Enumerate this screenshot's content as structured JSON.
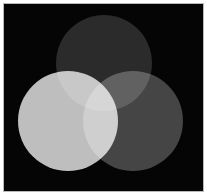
{
  "figure": {
    "width": 207,
    "height": 195,
    "background_color": "#ffffff",
    "plate_color": "#050505",
    "frame_color": "#b9b9b9",
    "blend_mode": "screen"
  },
  "chart_data": {
    "type": "diagram",
    "subtype": "venn-3-set",
    "xlabel": "",
    "ylabel": "",
    "grid": false,
    "legend": "none",
    "background_color": "#050505",
    "circles": [
      {
        "name": "top-circle",
        "label": "Top set",
        "cx": 104,
        "cy": 63,
        "r": 48,
        "color": "#272727",
        "brightness": 39
      },
      {
        "name": "left-circle",
        "label": "Lower-left set",
        "cx": 68,
        "cy": 121,
        "r": 50,
        "color": "#bdbdbd",
        "brightness": 189
      },
      {
        "name": "right-circle",
        "label": "Lower-right set",
        "cx": 133,
        "cy": 121,
        "r": 50,
        "color": "#414141",
        "brightness": 65
      }
    ],
    "overlap_colors": [
      {
        "name": "top-and-left",
        "sets": [
          "top-circle",
          "left-circle"
        ],
        "color": "#cdcdcd"
      },
      {
        "name": "top-and-right",
        "sets": [
          "top-circle",
          "right-circle"
        ],
        "color": "#2e2e2e"
      },
      {
        "name": "left-and-right",
        "sets": [
          "left-circle",
          "right-circle"
        ],
        "color": "#f2f2f2"
      },
      {
        "name": "all-three",
        "sets": [
          "top-circle",
          "left-circle",
          "right-circle"
        ],
        "color": "#f6f6f6"
      }
    ]
  }
}
